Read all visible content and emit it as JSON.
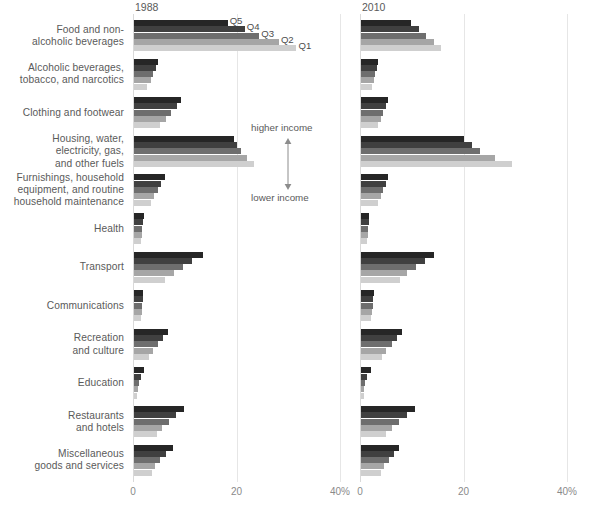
{
  "chart_data": {
    "type": "bar",
    "title": "",
    "subtitle": "",
    "orientation": "horizontal",
    "xlabel": "",
    "ylabel": "",
    "xlim": [
      0,
      40
    ],
    "xticks": [
      0,
      20,
      40
    ],
    "xtick_labels": [
      "0",
      "20",
      "40%"
    ],
    "grid": true,
    "legend_position": "inline-annotation-first-group",
    "panels": [
      {
        "key": "p1988",
        "label": "1988"
      },
      {
        "key": "p2010",
        "label": "2010"
      }
    ],
    "series_order_top_to_bottom": [
      "Q5",
      "Q4",
      "Q3",
      "Q2",
      "Q1"
    ],
    "series": [
      {
        "name": "Q5",
        "color": "#262626"
      },
      {
        "name": "Q4",
        "color": "#404040"
      },
      {
        "name": "Q3",
        "color": "#6e6e6e"
      },
      {
        "name": "Q2",
        "color": "#a6a6a6"
      },
      {
        "name": "Q1",
        "color": "#cfcfcf"
      }
    ],
    "categories": [
      "Food and non-alcoholic beverages",
      "Alcoholic beverages, tobacco, and narcotics",
      "Clothing and footwear",
      "Housing, water, electricity, gas, and other fuels",
      "Furnishings, household equipment, and routine household maintenance",
      "Health",
      "Transport",
      "Communications",
      "Recreation and culture",
      "Education",
      "Restaurants and hotels",
      "Miscellaneous goods and services"
    ],
    "category_label_lines": [
      [
        "Food and non-",
        "alcoholic beverages"
      ],
      [
        "Alcoholic beverages,",
        "tobacco, and narcotics"
      ],
      [
        "Clothing and footwear"
      ],
      [
        "Housing, water,",
        "electricity, gas,",
        "and other fuels"
      ],
      [
        "Furnishings, household",
        "equipment, and routine",
        "household maintenance"
      ],
      [
        "Health"
      ],
      [
        "Transport"
      ],
      [
        "Communications"
      ],
      [
        "Recreation",
        "and culture"
      ],
      [
        "Education"
      ],
      [
        "Restaurants",
        "and hotels"
      ],
      [
        "Miscellaneous",
        "goods and services"
      ]
    ],
    "p1988": {
      "Q5": [
        18.1,
        4.6,
        9.1,
        19.4,
        5.9,
        1.9,
        13.4,
        1.8,
        6.6,
        2.0,
        9.6,
        7.6
      ],
      "Q4": [
        21.4,
        4.2,
        8.4,
        19.9,
        5.3,
        1.7,
        11.3,
        1.7,
        5.7,
        1.3,
        8.2,
        6.1
      ],
      "Q3": [
        24.2,
        3.7,
        7.2,
        20.6,
        4.6,
        1.6,
        9.5,
        1.6,
        4.6,
        1.0,
        6.7,
        5.0
      ],
      "Q2": [
        28.0,
        3.2,
        6.1,
        21.8,
        3.9,
        1.5,
        7.7,
        1.5,
        3.7,
        0.8,
        5.4,
        4.1
      ],
      "Q1": [
        31.4,
        2.6,
        5.0,
        23.1,
        3.3,
        1.4,
        6.0,
        1.4,
        2.9,
        0.6,
        4.4,
        3.4
      ]
    },
    "p2010": {
      "Q5": [
        9.6,
        3.2,
        5.3,
        19.9,
        5.3,
        1.6,
        14.1,
        2.5,
        8.0,
        1.9,
        10.5,
        7.4
      ],
      "Q4": [
        11.3,
        3.0,
        4.8,
        21.4,
        4.8,
        1.5,
        12.3,
        2.4,
        7.0,
        1.1,
        8.9,
        6.3
      ],
      "Q3": [
        12.6,
        2.8,
        4.3,
        23.0,
        4.3,
        1.4,
        10.6,
        2.3,
        6.0,
        0.8,
        7.3,
        5.4
      ],
      "Q2": [
        14.1,
        2.5,
        3.8,
        25.8,
        3.8,
        1.3,
        8.9,
        2.1,
        4.9,
        0.6,
        6.0,
        4.5
      ],
      "Q1": [
        15.5,
        2.2,
        3.3,
        29.1,
        3.2,
        1.2,
        7.5,
        2.0,
        4.0,
        0.5,
        4.9,
        3.8
      ]
    },
    "annotations": {
      "quintile_labels": [
        "Q5",
        "Q4",
        "Q3",
        "Q2",
        "Q1"
      ],
      "higher_income": "higher income",
      "lower_income": "lower income"
    }
  }
}
